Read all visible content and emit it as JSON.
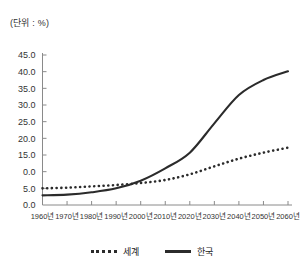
{
  "chart_data": {
    "type": "line",
    "title": "(단위 : %)",
    "xlabel": "",
    "ylabel": "",
    "ylim": [
      0,
      45
    ],
    "ytick_labels": [
      "45.0",
      "40.0",
      "35.0",
      "30.0",
      "25.0",
      "20.0",
      "15.0",
      "0.0",
      "5.0",
      "0.0"
    ],
    "ytick_values": [
      45,
      40,
      35,
      30,
      25,
      20,
      15,
      10,
      5,
      0
    ],
    "categories": [
      "1960년",
      "1970년",
      "1980년",
      "1990년",
      "2000년",
      "2010년",
      "2020년",
      "2030년",
      "2040년",
      "2050년",
      "2060년"
    ],
    "grid": false,
    "legend_position": "bottom",
    "series": [
      {
        "name": "세계",
        "style": "dotted",
        "color": "#2b2b2b",
        "values": [
          5.0,
          5.2,
          5.6,
          6.0,
          6.6,
          7.5,
          9.2,
          11.6,
          13.9,
          15.7,
          17.2
        ]
      },
      {
        "name": "한국",
        "style": "solid",
        "color": "#2b2b2b",
        "values": [
          2.9,
          3.1,
          3.8,
          5.0,
          7.3,
          11.0,
          15.7,
          24.5,
          33.0,
          37.5,
          40.1
        ]
      }
    ]
  },
  "legend": {
    "items": [
      {
        "label": "세계",
        "style": "dotted"
      },
      {
        "label": "한국",
        "style": "solid"
      }
    ]
  }
}
